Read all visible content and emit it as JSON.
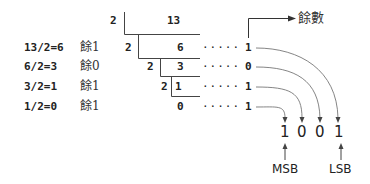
{
  "title_label": "餘數",
  "steps": [
    {
      "expr": "13/2=6",
      "rem_label": "餘1"
    },
    {
      "expr": "6/2=3",
      "rem_label": "餘0"
    },
    {
      "expr": "3/2=1",
      "rem_label": "餘1"
    },
    {
      "expr": "1/2=0",
      "rem_label": "餘1"
    }
  ],
  "ladder": {
    "divisor": "2",
    "quotients": [
      "13",
      "6",
      "3",
      "1",
      "0"
    ]
  },
  "dots": "·····",
  "remainders": [
    "1",
    "0",
    "1",
    "1"
  ],
  "result_bits": [
    "1",
    "0",
    "0",
    "1"
  ],
  "msb_label": "MSB",
  "lsb_label": "LSB",
  "colors": {
    "line": "#444444",
    "curve": "#666666",
    "text": "#222222"
  }
}
